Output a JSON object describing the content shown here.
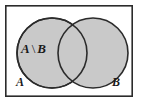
{
  "figure": {
    "type": "venn-diagram",
    "universe_label": "",
    "background_color": "#ffffff",
    "frame": {
      "name": "universal-set-rectangle",
      "x": 5,
      "y": 5,
      "width": 128,
      "height": 92,
      "stroke_color": "#2b2b2b",
      "stroke_width": 1.6,
      "fill_color": "#ffffff"
    },
    "circles": [
      {
        "name": "set-a-circle",
        "label": "A",
        "cx": 52,
        "cy": 53,
        "r": 35,
        "fill_color": "#c9c9c9",
        "stroke_color": "#2b2b2b",
        "stroke_width": 1.6
      },
      {
        "name": "set-b-circle",
        "label": "B",
        "cx": 93,
        "cy": 53,
        "r": 35,
        "fill_color": "#c9c9c9",
        "stroke_color": "#2b2b2b",
        "stroke_width": 1.6
      }
    ],
    "labels": {
      "expression_left": "A",
      "expression_operator": "\\",
      "expression_right": "B",
      "expression_full": "A \\ B",
      "set_a": "A",
      "set_b": "B"
    }
  },
  "chart_data": {
    "type": "diagram",
    "diagram_kind": "venn",
    "sets": [
      "A",
      "B"
    ],
    "regions": [
      {
        "id": "A-only",
        "label": "A \\ B",
        "shaded": true
      },
      {
        "id": "A-and-B",
        "label": "",
        "shaded": true
      },
      {
        "id": "B-only",
        "label": "",
        "shaded": true
      },
      {
        "id": "outside",
        "label": "",
        "shaded": false
      }
    ],
    "annotations": [
      "A \\ B",
      "A",
      "B"
    ]
  }
}
